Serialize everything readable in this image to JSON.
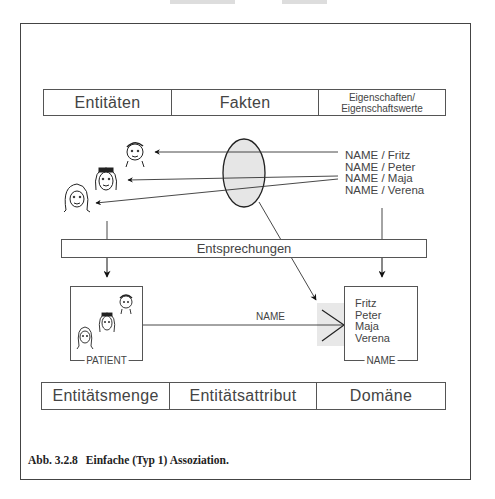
{
  "top_table": {
    "cells": [
      "Entitäten",
      "Fakten",
      "Eigenschaften/",
      "Eigenschaftswerte"
    ]
  },
  "facts": [
    "NAME / Fritz",
    "NAME / Peter",
    "NAME / Maja",
    "NAME / Verena"
  ],
  "mapping_bar": "Entsprechungen",
  "patient_box": {
    "label": "PATIENT"
  },
  "edge_label": "NAME",
  "name_box": {
    "label": "NAME",
    "values": [
      "Fritz",
      "Peter",
      "Maja",
      "Verena"
    ]
  },
  "bottom_table": {
    "cells": [
      "Entitätsmenge",
      "Entitätsattribut",
      "Domäne"
    ]
  },
  "caption": {
    "number": "Abb. 3.2.8",
    "text": "Einfache (Typ 1) Assoziation."
  },
  "colors": {
    "ellipse_fill": "#e6e6e6",
    "shade": "#e8e8e8",
    "stroke": "#333333"
  }
}
